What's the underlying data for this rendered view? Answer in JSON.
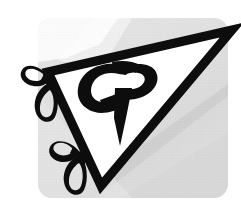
{
  "image": {
    "kind": "logo-mark",
    "title": "CP monogram triangle logo",
    "width": 241,
    "height": 206,
    "monogram_text": "CP",
    "style": "monochrome line-art / halftone scan"
  },
  "colors": {
    "page_background": "#ffffff",
    "card_background": "#dcdcdc",
    "card_background_light": "#e4e4e4",
    "shadow_band": "#cfcfcf",
    "ink": "#0d0d0d",
    "paper": "#ffffff"
  },
  "elements": {
    "backdrop_card": {
      "name": "Rounded gray card backdrop",
      "x": 38,
      "y": 18,
      "width": 190,
      "height": 180,
      "corner_radius": 14,
      "fill": "#dcdcdc"
    },
    "shadow_band": {
      "name": "Diagonal shadow band",
      "fill": "#cfcfcf"
    },
    "triangle": {
      "name": "Tilted outlined triangle",
      "vertices": [
        {
          "label": "left",
          "x": 48,
          "y": 72
        },
        {
          "label": "right",
          "x": 232,
          "y": 30
        },
        {
          "label": "bottom",
          "x": 101,
          "y": 186
        }
      ],
      "stroke": "#0d0d0d",
      "stroke_width": 9,
      "fill": "#ffffff"
    },
    "monogram": {
      "name": "CP monogram",
      "letters": [
        "C",
        "P"
      ],
      "fill": "#0d0d0d",
      "descender": "long tapering pointed tail"
    },
    "leaf_clusters": [
      {
        "name": "upper-left leaf pair",
        "anchor_x": 50,
        "anchor_y": 80,
        "leaf_count": 2
      },
      {
        "name": "lower-left leaf pair",
        "anchor_x": 78,
        "anchor_y": 152,
        "leaf_count": 2
      }
    ]
  },
  "a11y": {
    "alt_text": "Stylized CP monogram inside a tilted triangle decorated with leaf loops"
  }
}
